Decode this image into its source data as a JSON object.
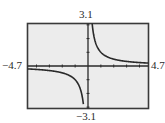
{
  "chart_data": {
    "type": "line",
    "title": "",
    "function": "y = 1/x",
    "xlabel": "",
    "ylabel": "",
    "xlim": [
      -4.7,
      4.7
    ],
    "ylim": [
      -3.1,
      3.1
    ],
    "xscl": 1,
    "yscl": 1,
    "grid": false,
    "legend": null,
    "window_labels": {
      "xmin": "-4.7",
      "xmax": "4.7",
      "ymin": "−3.1",
      "ymax": "3.1"
    },
    "series": [
      {
        "name": "y = 1/x (x < 0)",
        "x": [
          -4.7,
          -4.0,
          -3.0,
          -2.0,
          -1.5,
          -1.0,
          -0.75,
          -0.5,
          -0.4,
          -0.33
        ],
        "y": [
          -0.213,
          -0.25,
          -0.333,
          -0.5,
          -0.667,
          -1.0,
          -1.333,
          -2.0,
          -2.5,
          -3.03
        ]
      },
      {
        "name": "y = 1/x (x > 0)",
        "x": [
          0.33,
          0.4,
          0.5,
          0.75,
          1.0,
          1.5,
          2.0,
          3.0,
          4.0,
          4.7
        ],
        "y": [
          3.03,
          2.5,
          2.0,
          1.333,
          1.0,
          0.667,
          0.5,
          0.333,
          0.25,
          0.213
        ]
      }
    ]
  },
  "labels": {
    "ymax": "3.1",
    "ymin": "−3.1",
    "xmin": "−4.7",
    "xmax": "4.7"
  },
  "colors": {
    "screen_bg": "#ececec",
    "frame": "#3a3a3a",
    "axis": "#2a2a2a",
    "curve": "#2a2a2a"
  }
}
